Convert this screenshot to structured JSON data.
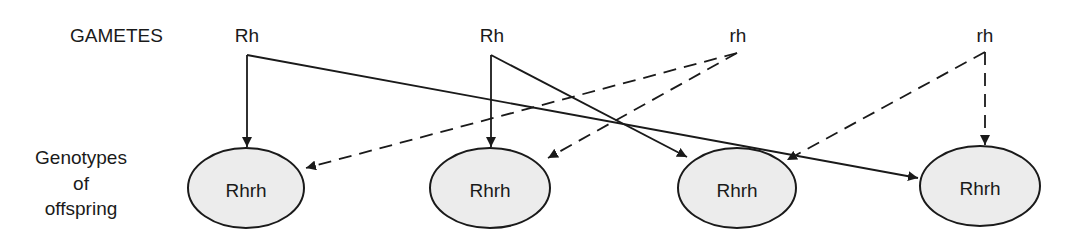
{
  "diagram": {
    "type": "genetic-cross-gametes-to-offspring",
    "row_labels": {
      "gametes": "GAMETES",
      "offspring_line1": "Genotypes",
      "offspring_line2": "of",
      "offspring_line3": "offspring"
    },
    "gametes": [
      {
        "id": "g1",
        "label": "Rh",
        "x": 247,
        "vx": 247,
        "vy": 55
      },
      {
        "id": "g2",
        "label": "Rh",
        "x": 492,
        "vx": 491,
        "vy": 55
      },
      {
        "id": "g3",
        "label": "rh",
        "x": 738,
        "vx": 737,
        "vy": 53
      },
      {
        "id": "g4",
        "label": "rh",
        "x": 985,
        "vx": 985,
        "vy": 52
      }
    ],
    "offspring": [
      {
        "id": "o1",
        "label": "Rhrh",
        "cx": 246,
        "cy": 188,
        "rx": 58,
        "ry": 40
      },
      {
        "id": "o2",
        "label": "Rhrh",
        "cx": 490,
        "cy": 188,
        "rx": 60,
        "ry": 40
      },
      {
        "id": "o3",
        "label": "Rhrh",
        "cx": 737,
        "cy": 188,
        "rx": 59,
        "ry": 40
      },
      {
        "id": "o4",
        "label": "Rhrh",
        "cx": 980,
        "cy": 186,
        "rx": 60,
        "ry": 40
      }
    ],
    "edges": [
      {
        "from": "g1",
        "to": "o1",
        "style": "solid",
        "x2": 247,
        "y2": 147
      },
      {
        "from": "g1",
        "to": "o4",
        "style": "solid",
        "x2": 918,
        "y2": 178
      },
      {
        "from": "g2",
        "to": "o2",
        "style": "solid",
        "x2": 491,
        "y2": 147
      },
      {
        "from": "g2",
        "to": "o3",
        "style": "solid",
        "x2": 687,
        "y2": 157
      },
      {
        "from": "g3",
        "to": "o1",
        "style": "dashed",
        "x2": 306,
        "y2": 168
      },
      {
        "from": "g3",
        "to": "o2",
        "style": "dashed",
        "x2": 548,
        "y2": 158
      },
      {
        "from": "g4",
        "to": "o3",
        "style": "dashed",
        "x2": 787,
        "y2": 160
      },
      {
        "from": "g4",
        "to": "o4",
        "style": "dashed",
        "x2": 985,
        "y2": 145
      }
    ],
    "colors": {
      "stroke": "#1a1a1a",
      "ellipse_fill": "#ececec",
      "background": "#ffffff"
    }
  }
}
